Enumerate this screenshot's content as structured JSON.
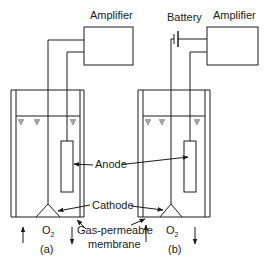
{
  "diagram": {
    "type": "electrochemical oxygen sensor schematic",
    "panels": [
      {
        "id": "a",
        "caption": "(a)",
        "top_labels": [
          "Amplifier"
        ],
        "components": [
          "Amplifier",
          "Anode",
          "Cathode",
          "Gas-permeable membrane",
          "Electrolyte"
        ],
        "gas_label": "O",
        "gas_subscript": "2"
      },
      {
        "id": "b",
        "caption": "(b)",
        "top_labels": [
          "Battery",
          "Amplifier"
        ],
        "components": [
          "Battery",
          "Amplifier",
          "Anode",
          "Cathode",
          "Gas-permeable membrane",
          "Electrolyte"
        ],
        "gas_label": "O",
        "gas_subscript": "2"
      }
    ],
    "labels": {
      "amplifier_a": "Amplifier",
      "amplifier_b": "Amplifier",
      "battery": "Battery",
      "anode": "Anode",
      "cathode": "Cathode",
      "membrane_line1": "Gas-permeable",
      "membrane_line2": "membrane",
      "o2_a": "O",
      "o2_a_sub": "2",
      "o2_b": "O",
      "o2_b_sub": "2",
      "caption_a": "(a)",
      "caption_b": "(b)"
    },
    "colors": {
      "stroke": "#1a1a1a",
      "background": "#ffffff"
    }
  }
}
